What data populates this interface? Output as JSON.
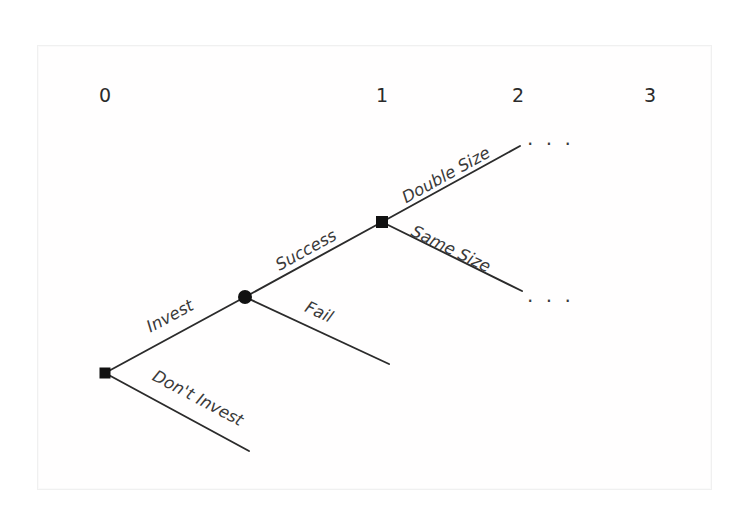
{
  "figure": {
    "kind": "decision-tree",
    "background_color": "#ffffff",
    "frame_color": "#f0f0f0",
    "ink_color": "#2b2b2b",
    "width": 755,
    "height": 511
  },
  "axis": {
    "label": "",
    "tick_y": 95,
    "ticks": [
      {
        "text": "0",
        "x": 105
      },
      {
        "text": "1",
        "x": 382
      },
      {
        "text": "2",
        "x": 518
      },
      {
        "text": "3",
        "x": 650
      }
    ]
  },
  "nodes": [
    {
      "id": "root",
      "type": "decision-square",
      "label": "",
      "x": 105,
      "y": 373,
      "size": 11,
      "period": "0"
    },
    {
      "id": "chance1",
      "type": "chance-circle",
      "label": "",
      "x": 245,
      "y": 297,
      "radius": 7,
      "period": "0.5"
    },
    {
      "id": "decision2",
      "type": "decision-square",
      "label": "",
      "x": 382,
      "y": 222,
      "size": 12,
      "period": "1"
    }
  ],
  "edges": [
    {
      "id": "invest",
      "label": "Invest",
      "from": "root",
      "to": "chance1",
      "x1": 105,
      "y1": 373,
      "x2": 245,
      "y2": 297,
      "label_x": 170,
      "label_y": 316,
      "label_rotation": -28
    },
    {
      "id": "dont-invest",
      "label": "Don't Invest",
      "from": "root",
      "to": "terminal-dont-invest",
      "x1": 105,
      "y1": 373,
      "x2": 249,
      "y2": 451,
      "label_x": 198,
      "label_y": 398,
      "label_rotation": 28
    },
    {
      "id": "success",
      "label": "Success",
      "from": "chance1",
      "to": "decision2",
      "x1": 245,
      "y1": 297,
      "x2": 382,
      "y2": 222,
      "label_x": 306,
      "label_y": 250,
      "label_rotation": -29
    },
    {
      "id": "fail",
      "label": "Fail",
      "from": "chance1",
      "to": "terminal-fail",
      "x1": 245,
      "y1": 297,
      "x2": 389,
      "y2": 364,
      "label_x": 319,
      "label_y": 312,
      "label_rotation": 25
    },
    {
      "id": "double-size",
      "label": "Double Size",
      "from": "decision2",
      "to": "terminal-double-size",
      "x1": 382,
      "y1": 222,
      "x2": 520,
      "y2": 146,
      "label_x": 446,
      "label_y": 175,
      "label_rotation": -29
    },
    {
      "id": "same-size",
      "label": "Same Size",
      "from": "decision2",
      "to": "terminal-same-size",
      "x1": 382,
      "y1": 222,
      "x2": 522,
      "y2": 291,
      "label_x": 451,
      "label_y": 249,
      "label_rotation": 26
    }
  ],
  "continuations": [
    {
      "id": "double-size-continuation",
      "text": "· · ·",
      "x": 527,
      "y": 144
    },
    {
      "id": "same-size-continuation",
      "text": "· · ·",
      "x": 527,
      "y": 301
    }
  ]
}
